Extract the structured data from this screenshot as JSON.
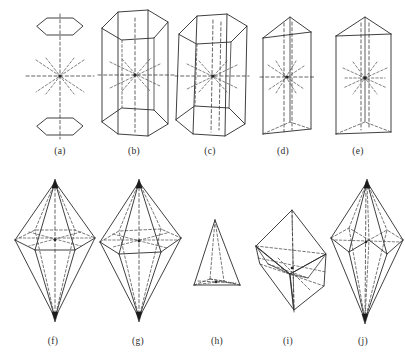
{
  "plate": {
    "title": "Crystal form symmetry plate",
    "background_color": "#ffffff",
    "stroke_color": "#2a2a2a",
    "hidden_edge_color": "#4a4a4a",
    "axis_color": "#3d3d3d",
    "width": 405,
    "height": 358,
    "rows": 2,
    "columns": 5
  },
  "figures": [
    {
      "id": "a",
      "label": "(a)",
      "name": "hexagonal-dipyramid-open-pair",
      "row": 1,
      "column": 1,
      "caption_x": 60,
      "caption_y": 151
    },
    {
      "id": "b",
      "label": "(b)",
      "name": "hexagonal-prism-tall",
      "row": 1,
      "column": 2,
      "caption_x": 134,
      "caption_y": 151
    },
    {
      "id": "c",
      "label": "(c)",
      "name": "hexagonal-prism-tilted",
      "row": 1,
      "column": 3,
      "caption_x": 210,
      "caption_y": 151
    },
    {
      "id": "d",
      "label": "(d)",
      "name": "triangular-prism-narrow",
      "row": 1,
      "column": 4,
      "caption_x": 283,
      "caption_y": 151
    },
    {
      "id": "e",
      "label": "(e)",
      "name": "triangular-prism-wide",
      "row": 1,
      "column": 5,
      "caption_x": 358,
      "caption_y": 151
    },
    {
      "id": "f",
      "label": "(f)",
      "name": "hexagonal-dipyramid-slender",
      "row": 2,
      "column": 1,
      "caption_x": 53,
      "caption_y": 341
    },
    {
      "id": "g",
      "label": "(g)",
      "name": "hexagonal-dipyramid-broad",
      "row": 2,
      "column": 2,
      "caption_x": 138,
      "caption_y": 341
    },
    {
      "id": "h",
      "label": "(h)",
      "name": "trigonal-pyramid",
      "row": 2,
      "column": 3,
      "caption_x": 217,
      "caption_y": 341
    },
    {
      "id": "i",
      "label": "(i)",
      "name": "rhombohedron-tilted",
      "row": 2,
      "column": 4,
      "caption_x": 288,
      "caption_y": 341
    },
    {
      "id": "j",
      "label": "(j)",
      "name": "scalenohedron",
      "row": 2,
      "column": 5,
      "caption_x": 363,
      "caption_y": 341
    }
  ]
}
